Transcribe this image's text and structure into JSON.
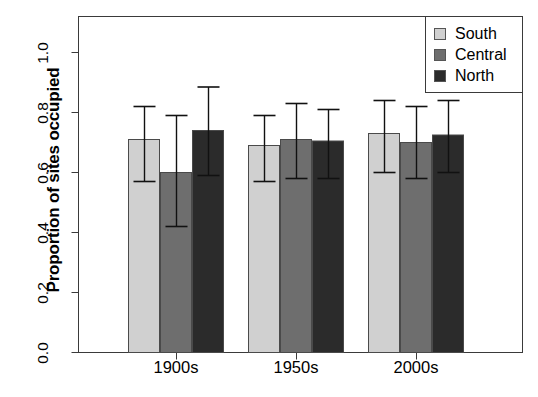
{
  "chart_data": {
    "type": "bar",
    "title": "",
    "subtitle": "",
    "xlabel": "",
    "ylabel": "Proportion of sites occupied",
    "categories": [
      "1900s",
      "1950s",
      "2000s"
    ],
    "ylim": [
      0.0,
      1.0
    ],
    "y_ticks": [
      "0.0",
      "0.2",
      "0.4",
      "0.6",
      "0.8",
      "1.0"
    ],
    "y_tick_values": [
      0.0,
      0.2,
      0.4,
      0.6,
      0.8,
      1.0
    ],
    "grid": false,
    "legend_position": "top-right",
    "error_bars": "vertical whisker with caps",
    "series": [
      {
        "name": "South",
        "color": "#d0d0d0",
        "values": [
          0.71,
          0.69,
          0.73
        ],
        "err_low": [
          0.57,
          0.57,
          0.6
        ],
        "err_high": [
          0.82,
          0.79,
          0.84
        ]
      },
      {
        "name": "Central",
        "color": "#6e6e6e",
        "values": [
          0.6,
          0.71,
          0.7
        ],
        "err_low": [
          0.42,
          0.58,
          0.58
        ],
        "err_high": [
          0.79,
          0.83,
          0.82
        ]
      },
      {
        "name": "North",
        "color": "#2b2b2b",
        "values": [
          0.74,
          0.705,
          0.725
        ],
        "err_low": [
          0.59,
          0.58,
          0.6
        ],
        "err_high": [
          0.885,
          0.81,
          0.84
        ]
      }
    ]
  },
  "legend": {
    "items": [
      {
        "label": "South",
        "color": "#d0d0d0"
      },
      {
        "label": "Central",
        "color": "#6e6e6e"
      },
      {
        "label": "North",
        "color": "#2b2b2b"
      }
    ]
  },
  "axis": {
    "y_title": "Proportion of sites occupied",
    "y_ticks": [
      "0.0",
      "0.2",
      "0.4",
      "0.6",
      "0.8",
      "1.0"
    ],
    "x_ticks": [
      "1900s",
      "1950s",
      "2000s"
    ]
  }
}
